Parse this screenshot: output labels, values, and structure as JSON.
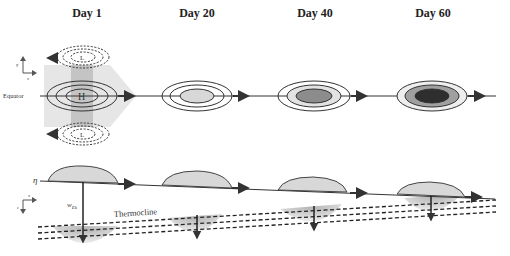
{
  "titles": {
    "day1": "Day 1",
    "day20": "Day 20",
    "day40": "Day 40",
    "day60": "Day 60"
  },
  "top_panel": {
    "equator_label": "Equator",
    "high_label": "H",
    "low_label_north": "L",
    "low_label_south": "L",
    "axes": {
      "vertical": "y",
      "horizontal": "x"
    }
  },
  "bottom_panel": {
    "surface_label": "η",
    "ekman_label": "w",
    "ekman_sub": "Ek",
    "thermocline_label": "Thermocline",
    "axes": {
      "vertical": "z",
      "horizontal": "x"
    }
  },
  "colors": {
    "light_fill": "#d8d8d8",
    "medium_fill": "#a8a8a8",
    "dark_fill": "#3a3a3a",
    "line": "#333333",
    "shade_band": "#e6e6e6"
  }
}
